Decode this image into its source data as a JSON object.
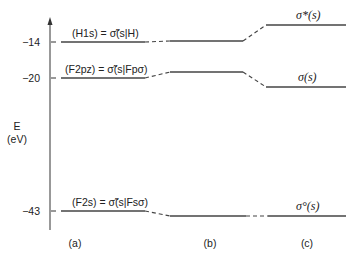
{
  "diagram": {
    "type": "energy-level-diagram",
    "axis": {
      "title": "E",
      "unit": "(eV)",
      "ticks": [
        {
          "label": "−14",
          "value": -14
        },
        {
          "label": "−20",
          "value": -20
        },
        {
          "label": "−43",
          "value": -43
        }
      ]
    },
    "columns": [
      {
        "id": "a",
        "label": "(a)"
      },
      {
        "id": "b",
        "label": "(b)"
      },
      {
        "id": "c",
        "label": "(c)"
      }
    ],
    "levels_a": [
      {
        "label": "(H1s) = σ̃(s|H)",
        "energy": -14
      },
      {
        "label": "(F2pz) = σ̃(s|Fpσ)",
        "energy": -20
      },
      {
        "label": "(F2s) = σ̃(s|Fsσ)",
        "energy": -43
      }
    ],
    "levels_c": [
      {
        "label": "σ*(s)",
        "energy": -11
      },
      {
        "label": "σ(s)",
        "energy": -21.5
      },
      {
        "label": "σ°(s)",
        "energy": -43.5
      }
    ]
  }
}
